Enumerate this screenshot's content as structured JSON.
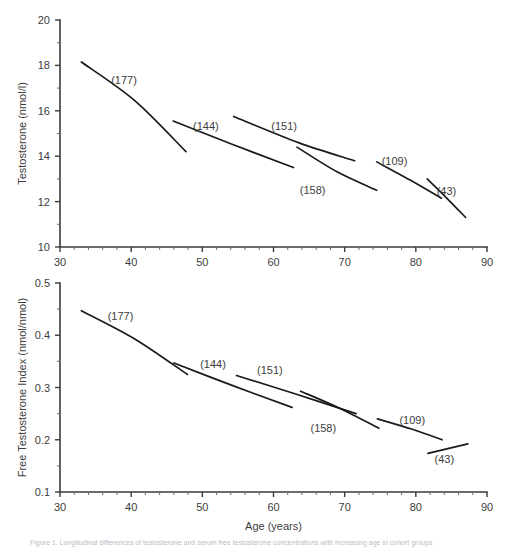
{
  "figure": {
    "caption": "Figure 1. Longitudinal differences of testosterone and serum free testosterone concentrations with increasing age in cohort groups",
    "background": "#ffffff",
    "line_color": "#1a1a1a",
    "axis_color": "#3b3b3b",
    "text_color": "#3d3d3d"
  },
  "chart_data": [
    {
      "id": "testosterone-panel",
      "type": "line",
      "title": "",
      "xlabel": "",
      "ylabel": "Testosterone (nmol/l)",
      "xlim": [
        30,
        90
      ],
      "ylim": [
        10,
        20
      ],
      "xticks": [
        30,
        40,
        50,
        60,
        70,
        80,
        90
      ],
      "xtick_labels": [
        "30",
        "40",
        "50",
        "60",
        "70",
        "80",
        "90"
      ],
      "xminor_step": 2,
      "yticks": [
        10,
        12,
        14,
        16,
        18,
        20
      ],
      "ytick_labels": [
        "10",
        "12",
        "14",
        "16",
        "18",
        "20"
      ],
      "yminor_step": 1,
      "grid": false,
      "legend": "none",
      "series": [
        {
          "name": "(177)",
          "label": "(177)",
          "label_x": 39.0,
          "label_y": 17.35,
          "points": [
            [
              33.0,
              18.15
            ],
            [
              40.5,
              16.45
            ],
            [
              47.7,
              14.2
            ]
          ]
        },
        {
          "name": "(144)",
          "label": "(144)",
          "label_x": 50.5,
          "label_y": 15.35,
          "points": [
            [
              45.9,
              15.55
            ],
            [
              54.0,
              14.55
            ],
            [
              62.8,
              13.5
            ]
          ]
        },
        {
          "name": "(151)",
          "label": "(151)",
          "label_x": 61.5,
          "label_y": 15.35,
          "points": [
            [
              54.4,
              15.75
            ],
            [
              63.5,
              14.6
            ],
            [
              71.4,
              13.8
            ]
          ]
        },
        {
          "name": "(158)",
          "label": "(158)",
          "label_x": 65.5,
          "label_y": 12.5,
          "points": [
            [
              63.3,
              14.4
            ],
            [
              69.0,
              13.3
            ],
            [
              74.5,
              12.5
            ]
          ]
        },
        {
          "name": "(109)",
          "label": "(109)",
          "label_x": 77.0,
          "label_y": 13.8,
          "points": [
            [
              74.5,
              13.75
            ],
            [
              79.5,
              12.9
            ],
            [
              83.6,
              12.15
            ]
          ]
        },
        {
          "name": "(43)",
          "label": "(43)",
          "label_x": 84.3,
          "label_y": 12.45,
          "points": [
            [
              81.6,
              13.0
            ],
            [
              84.2,
              12.2
            ],
            [
              87.0,
              11.3
            ]
          ]
        }
      ]
    },
    {
      "id": "free-testosterone-panel",
      "type": "line",
      "title": "",
      "xlabel": "Age (years)",
      "ylabel": "Free Testosterone Index (nmol/nmol)",
      "xlim": [
        30,
        90
      ],
      "ylim": [
        0.1,
        0.5
      ],
      "xticks": [
        30,
        40,
        50,
        60,
        70,
        80,
        90
      ],
      "xtick_labels": [
        "30",
        "40",
        "50",
        "60",
        "70",
        "80",
        "90"
      ],
      "xminor_step": 2,
      "yticks": [
        0.1,
        0.2,
        0.3,
        0.4,
        0.5
      ],
      "ytick_labels": [
        "0.1",
        "0.2",
        "0.3",
        "0.4",
        "0.5"
      ],
      "yminor_step": 0.05,
      "grid": false,
      "legend": "none",
      "series": [
        {
          "name": "(177)",
          "label": "(177)",
          "label_x": 38.5,
          "label_y": 0.437,
          "points": [
            [
              33.0,
              0.447
            ],
            [
              40.5,
              0.393
            ],
            [
              47.9,
              0.325
            ]
          ]
        },
        {
          "name": "(144)",
          "label": "(144)",
          "label_x": 51.5,
          "label_y": 0.345,
          "points": [
            [
              46.0,
              0.347
            ],
            [
              54.0,
              0.305
            ],
            [
              62.6,
              0.262
            ]
          ]
        },
        {
          "name": "(151)",
          "label": "(151)",
          "label_x": 59.5,
          "label_y": 0.333,
          "points": [
            [
              54.8,
              0.323
            ],
            [
              63.0,
              0.288
            ],
            [
              71.6,
              0.25
            ]
          ]
        },
        {
          "name": "(158)",
          "label": "(158)",
          "label_x": 67.0,
          "label_y": 0.223,
          "points": [
            [
              63.8,
              0.293
            ],
            [
              69.0,
              0.262
            ],
            [
              74.8,
              0.222
            ]
          ]
        },
        {
          "name": "(109)",
          "label": "(109)",
          "label_x": 79.5,
          "label_y": 0.237,
          "points": [
            [
              74.6,
              0.24
            ],
            [
              79.5,
              0.22
            ],
            [
              83.7,
              0.2
            ]
          ]
        },
        {
          "name": "(43)",
          "label": "(43)",
          "label_x": 84.0,
          "label_y": 0.163,
          "points": [
            [
              81.7,
              0.174
            ],
            [
              84.5,
              0.183
            ],
            [
              87.3,
              0.192
            ]
          ]
        }
      ]
    }
  ]
}
